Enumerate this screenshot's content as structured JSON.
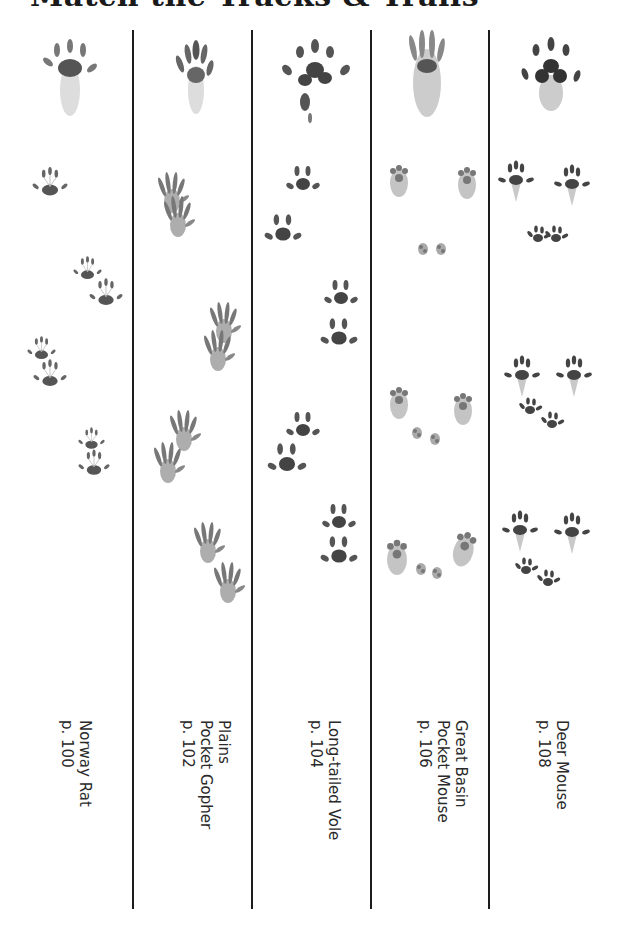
{
  "page": {
    "title": "Match the Tracks & Trails"
  },
  "columns": [
    {
      "id": "norway-rat",
      "name_lines": [
        "Norway Rat"
      ],
      "page_ref": "p. 100",
      "label_text": "Norway Rat\np. 100",
      "track_style": "rat"
    },
    {
      "id": "plains-pocket-gopher",
      "name_lines": [
        "Plains",
        "Pocket Gopher"
      ],
      "page_ref": "p. 102",
      "label_text": "Plains\nPocket Gopher\np. 102",
      "track_style": "gopher"
    },
    {
      "id": "long-tailed-vole",
      "name_lines": [
        "Long-tailed Vole"
      ],
      "page_ref": "p. 104",
      "label_text": "Long-tailed Vole\np. 104",
      "track_style": "vole"
    },
    {
      "id": "great-basin-pocket-mouse",
      "name_lines": [
        "Great Basin",
        "Pocket Mouse"
      ],
      "page_ref": "p. 106",
      "label_text": "Great Basin\nPocket Mouse\np. 106",
      "track_style": "pocket-mouse"
    },
    {
      "id": "deer-mouse",
      "name_lines": [
        "Deer Mouse"
      ],
      "page_ref": "p. 108",
      "label_text": "Deer Mouse\np. 108",
      "track_style": "deer-mouse"
    }
  ],
  "colors": {
    "ink": "#1c1c1c",
    "track": "#5a5a5a",
    "track_light": "#9a9a9a",
    "text": "#2a2a2a"
  }
}
